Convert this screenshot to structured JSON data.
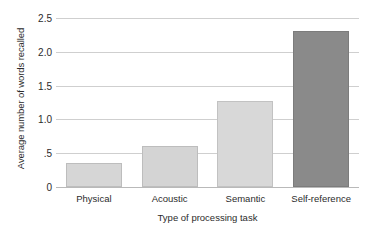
{
  "chart_data": {
    "type": "bar",
    "title": "",
    "subtitle": "",
    "xlabel": "Type of processing task",
    "ylabel": "Average number of words recalled",
    "categories": [
      "Physical",
      "Acoustic",
      "Semantic",
      "Self-reference"
    ],
    "values": [
      0.35,
      0.6,
      1.27,
      2.31
    ],
    "series": [
      {
        "name": "Average number of words recalled",
        "values": [
          0.35,
          0.6,
          1.27,
          2.31
        ]
      }
    ],
    "ylim": [
      0,
      2.5
    ],
    "yticks": [
      0,
      0.5,
      1.0,
      1.5,
      2.0,
      2.5
    ],
    "ytick_labels": [
      "0",
      ".5",
      "1.0",
      "1.5",
      "2.0",
      "2.5"
    ],
    "grid": true,
    "grid_axis": "y",
    "legend": false,
    "legend_position": "none",
    "bar_colors": [
      "#d6d6d6",
      "#d4d4d4",
      "#d8d8d8",
      "#8a8a8a"
    ],
    "bar_edge_colors": [
      "#bdbdbd",
      "#bdbdbd",
      "#c2c2c2",
      "#7c7c7c"
    ],
    "annotations": [],
    "background_color": "#ffffff",
    "gridline_color": "#cfcfcf",
    "axis_color": "#b9b9b9",
    "text_color": "#2b2b2b"
  }
}
